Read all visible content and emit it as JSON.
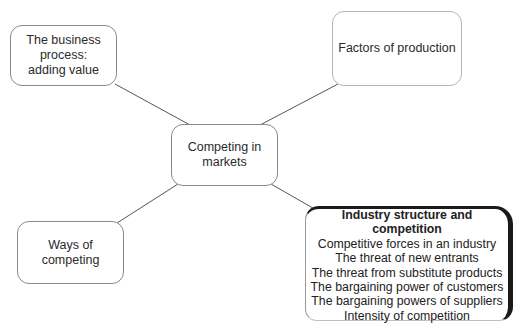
{
  "diagram": {
    "type": "mind-map",
    "center": {
      "id": "competing",
      "label_lines": [
        "Competing in",
        "markets"
      ]
    },
    "nodes": [
      {
        "id": "business",
        "label_lines": [
          "The business",
          "process:",
          "adding value"
        ]
      },
      {
        "id": "factors",
        "label_lines": [
          "Factors of production"
        ]
      },
      {
        "id": "ways",
        "label_lines": [
          "Ways of",
          "competing"
        ]
      },
      {
        "id": "industry",
        "highlighted": true,
        "heading": "Industry structure and competition",
        "items": [
          "Competitive forces in an industry",
          "The threat of new entrants",
          "The threat from substitute products",
          "The bargaining power of customers",
          "The bargaining powers of suppliers",
          "Intensity of competition"
        ]
      }
    ],
    "edges": [
      {
        "from": "competing",
        "to": "business"
      },
      {
        "from": "competing",
        "to": "factors"
      },
      {
        "from": "competing",
        "to": "ways"
      },
      {
        "from": "competing",
        "to": "industry"
      }
    ],
    "colors": {
      "line": "#555555",
      "box_border": "#8a8a8a",
      "highlight_border": "#1a1a1a",
      "text": "#2a2a2a"
    }
  }
}
